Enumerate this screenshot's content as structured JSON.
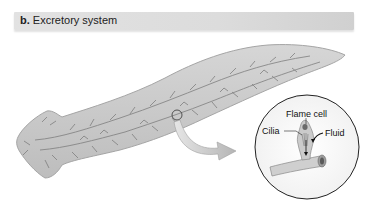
{
  "figure": {
    "panel_letter": "b.",
    "title": "Excretory system"
  },
  "inset": {
    "labels": {
      "flame_cell": "Flame cell",
      "cilia": "Cilia",
      "fluid": "Fluid"
    }
  },
  "colors": {
    "header_bg": "#dcdcdc",
    "body_fill": "#c9c9c9",
    "body_outline": "#9a9a9a",
    "tubule": "#7a7a7a",
    "inset_outline": "#222222"
  }
}
